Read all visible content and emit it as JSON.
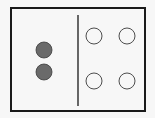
{
  "diagram": {
    "colors": {
      "background": "#f7f7f7",
      "frame": "#1a1a1a",
      "filled_circle": "#6a6a6a",
      "filled_stroke": "#3a3a3a",
      "empty_circle_stroke": "#3a3a3a"
    },
    "frame": {
      "x": 11,
      "y": 8,
      "width": 134,
      "height": 103,
      "stroke_width": 2
    },
    "divider": {
      "x": 78,
      "y1": 15,
      "y2": 106
    },
    "left_group": {
      "label": "filled circles",
      "count": 2,
      "circles": [
        {
          "cx": 44,
          "cy": 50,
          "r": 8
        },
        {
          "cx": 44,
          "cy": 72,
          "r": 8
        }
      ]
    },
    "right_group": {
      "label": "empty circles",
      "count": 4,
      "circles": [
        {
          "cx": 94,
          "cy": 36,
          "r": 8
        },
        {
          "cx": 127,
          "cy": 36,
          "r": 8
        },
        {
          "cx": 94,
          "cy": 81,
          "r": 8
        },
        {
          "cx": 127,
          "cy": 81,
          "r": 8
        }
      ]
    }
  }
}
